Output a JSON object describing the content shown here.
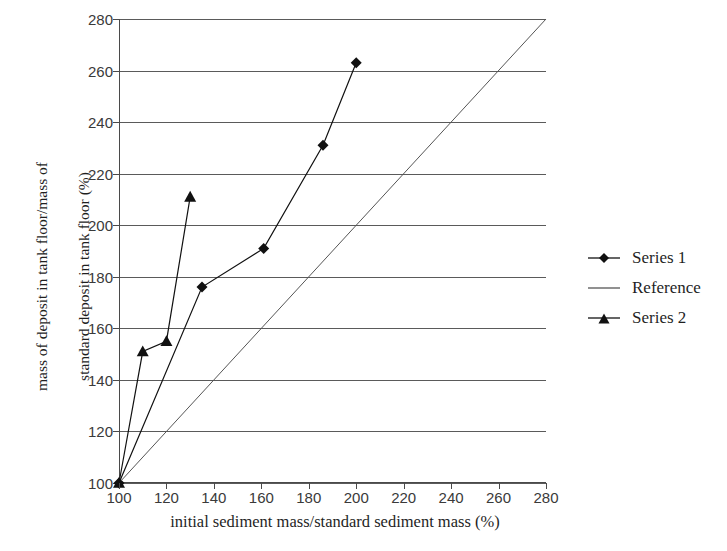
{
  "chart_data": {
    "type": "line",
    "title": "",
    "xlabel": "initial sediment mass/standard sediment mass (%)",
    "ylabel": "mass of deposit in tank floor/mass of\nstandard deposit in tank floor (%)",
    "xlim": [
      100,
      280
    ],
    "ylim": [
      100,
      280
    ],
    "xticks": [
      100,
      120,
      140,
      160,
      180,
      200,
      220,
      240,
      260,
      280
    ],
    "yticks": [
      100,
      120,
      140,
      160,
      180,
      200,
      220,
      240,
      260,
      280
    ],
    "grid": "horizontal",
    "legend_position": "right",
    "series": [
      {
        "name": "Series 1",
        "marker": "diamond",
        "color": "#111111",
        "points": [
          {
            "x": 100,
            "y": 100
          },
          {
            "x": 135,
            "y": 176
          },
          {
            "x": 161,
            "y": 191
          },
          {
            "x": 186,
            "y": 231
          },
          {
            "x": 200,
            "y": 263
          }
        ]
      },
      {
        "name": "Reference",
        "marker": "none",
        "color": "#555555",
        "points": [
          {
            "x": 100,
            "y": 100
          },
          {
            "x": 280,
            "y": 280
          }
        ]
      },
      {
        "name": "Series 2",
        "marker": "triangle",
        "color": "#111111",
        "points": [
          {
            "x": 100,
            "y": 100
          },
          {
            "x": 110,
            "y": 151
          },
          {
            "x": 120,
            "y": 155
          },
          {
            "x": 130,
            "y": 211
          }
        ]
      }
    ]
  },
  "axes": {
    "y_title_line1": "mass of deposit in tank floor/mass of",
    "y_title_line2": "standard deposit in tank floor (%)",
    "x_title": "initial sediment mass/standard sediment mass (%)",
    "ytick_labels": [
      "280",
      "260",
      "240",
      "220",
      "200",
      "180",
      "160",
      "140",
      "120",
      "100"
    ],
    "xtick_labels": [
      "100",
      "120",
      "140",
      "160",
      "180",
      "200",
      "220",
      "240",
      "260",
      "280"
    ]
  },
  "legend": {
    "items": [
      {
        "label": "Series 1",
        "marker": "diamond-icon"
      },
      {
        "label": "Reference",
        "marker": "line-icon"
      },
      {
        "label": "Series 2",
        "marker": "triangle-icon"
      }
    ]
  },
  "colors": {
    "series1": "#111111",
    "reference": "#555555",
    "series2": "#111111",
    "grid": "#5a5a5a",
    "axis": "#4a4a4a",
    "text": "#1f1f1f",
    "tick_text": "#3a3a3a",
    "background": "#ffffff"
  }
}
